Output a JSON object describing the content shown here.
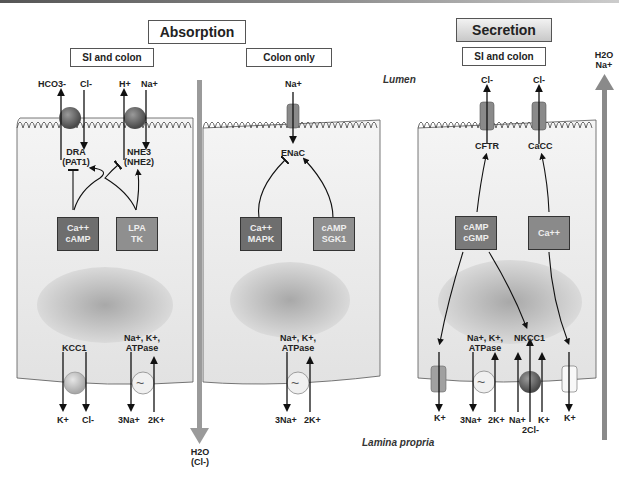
{
  "header": {
    "absorption_title": "Absorption",
    "secretion_title": "Secretion"
  },
  "panels": {
    "si_colon_absorption": "SI and colon",
    "colon_only": "Colon only",
    "si_colon_secretion": "SI and colon"
  },
  "regions": {
    "lumen": "Lumen",
    "lamina_propria": "Lamina propria"
  },
  "flows": {
    "absorption_arrow": {
      "line1": "H2O",
      "line2": "(Cl-)"
    },
    "secretion_arrow": {
      "line1": "H2O",
      "line2": "Na+"
    }
  },
  "cell1": {
    "apical_ions": [
      "HCO3-",
      "Cl-",
      "H+",
      "Na+"
    ],
    "transporter1": {
      "name": "DRA",
      "alt": "(PAT1)"
    },
    "transporter2": {
      "name": "NHE3",
      "alt": "(NHE2)"
    },
    "signal1": {
      "line1": "Ca++",
      "line2": "cAMP"
    },
    "signal2": {
      "line1": "LPA",
      "line2": "TK"
    },
    "kcc": "KCC1",
    "atpase": {
      "line1": "Na+, K+,",
      "line2": "ATPase"
    },
    "basal_ions": [
      "K+",
      "Cl-",
      "3Na+",
      "2K+"
    ]
  },
  "cell2": {
    "apical_ion": "Na+",
    "channel": "ENaC",
    "signal1": {
      "line1": "Ca++",
      "line2": "MAPK"
    },
    "signal2": {
      "line1": "cAMP",
      "line2": "SGK1"
    },
    "atpase": {
      "line1": "Na+, K+,",
      "line2": "ATPase"
    },
    "basal_ions": [
      "3Na+",
      "2K+"
    ]
  },
  "cell3": {
    "apical_ions": [
      "Cl-",
      "Cl-"
    ],
    "channel1": "CFTR",
    "channel2": "CaCC",
    "signal1": {
      "line1": "cAMP",
      "line2": "cGMP"
    },
    "signal2": {
      "line1": "Ca++"
    },
    "atpase": {
      "line1": "Na+, K+,",
      "line2": "ATPase"
    },
    "nkcc": "NKCC1",
    "basal_ions": [
      "K+",
      "3Na+",
      "2K+",
      "Na+",
      "2Cl-",
      "K+",
      "K+"
    ]
  },
  "colors": {
    "dark_box": "#6e6e6e",
    "light_box": "#8f8f8f",
    "channel": "#8a8a8a",
    "flow_arrow": "#9a9a9a",
    "cell_bg": "#ececec"
  }
}
